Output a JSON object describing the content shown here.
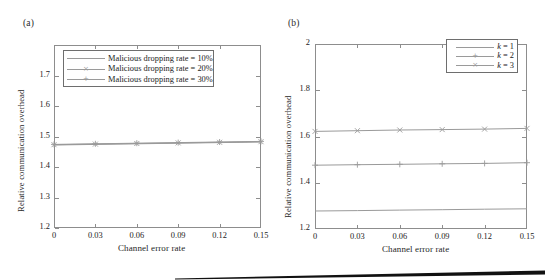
{
  "figure": {
    "panels": [
      {
        "tag": "(a)",
        "ylabel": "Relative communication overhead",
        "xlabel": "Channel error rate",
        "yticks": [
          "1.2",
          "1.3",
          "1.4",
          "1.5",
          "1.6",
          "1.7",
          ""
        ],
        "xticks": [
          "0",
          "0.03",
          "0.06",
          "0.09",
          "0.12",
          "0.15"
        ],
        "legend": [
          {
            "text": "Malicious dropping rate = 10%",
            "marker": "none"
          },
          {
            "text": "Malicious dropping rate = 20%",
            "marker": "x"
          },
          {
            "text": "Malicious dropping rate = 30%",
            "marker": "plus"
          }
        ]
      },
      {
        "tag": "(b)",
        "ylabel": "Relative communication overhead",
        "xlabel": "Channel error rate",
        "yticks": [
          "1.2",
          "1.4",
          "1.6",
          "1.8",
          "2"
        ],
        "xticks": [
          "0",
          "0.03",
          "0.06",
          "0.09",
          "0.12",
          "0.15"
        ],
        "legend": [
          {
            "text": "k = 1",
            "marker": "none"
          },
          {
            "text": "k = 2",
            "marker": "plus"
          },
          {
            "text": "k = 3",
            "marker": "x"
          }
        ]
      }
    ],
    "line_color": "#9a9a9a",
    "axis_color": "#8d8d8d"
  },
  "chart_data": [
    {
      "type": "line",
      "title": "(a)",
      "xlabel": "Channel error rate",
      "ylabel": "Relative communication overhead",
      "xlim": [
        0,
        0.15
      ],
      "ylim": [
        1.2,
        1.8
      ],
      "xticks": [
        0,
        0.03,
        0.06,
        0.09,
        0.12,
        0.15
      ],
      "yticks": [
        1.2,
        1.3,
        1.4,
        1.5,
        1.6,
        1.7
      ],
      "grid": false,
      "legend_position": "upper-left-inside",
      "x": [
        0,
        0.03,
        0.06,
        0.09,
        0.12,
        0.15
      ],
      "series": [
        {
          "name": "Malicious dropping rate = 10%",
          "marker": "none",
          "values": [
            1.472,
            1.474,
            1.476,
            1.478,
            1.48,
            1.482
          ]
        },
        {
          "name": "Malicious dropping rate = 20%",
          "marker": "x",
          "values": [
            1.473,
            1.475,
            1.477,
            1.479,
            1.481,
            1.483
          ]
        },
        {
          "name": "Malicious dropping rate = 30%",
          "marker": "plus",
          "values": [
            1.474,
            1.476,
            1.478,
            1.48,
            1.482,
            1.484
          ]
        }
      ]
    },
    {
      "type": "line",
      "title": "(b)",
      "xlabel": "Channel error rate",
      "ylabel": "Relative communication overhead",
      "xlim": [
        0,
        0.15
      ],
      "ylim": [
        1.2,
        2.0
      ],
      "xticks": [
        0,
        0.03,
        0.06,
        0.09,
        0.12,
        0.15
      ],
      "yticks": [
        1.2,
        1.4,
        1.6,
        1.8,
        2.0
      ],
      "grid": false,
      "legend_position": "upper-right-inside",
      "x": [
        0,
        0.03,
        0.06,
        0.09,
        0.12,
        0.15
      ],
      "series": [
        {
          "name": "k = 1",
          "marker": "none",
          "values": [
            1.278,
            1.28,
            1.282,
            1.284,
            1.286,
            1.288
          ]
        },
        {
          "name": "k = 2",
          "marker": "plus",
          "values": [
            1.476,
            1.478,
            1.48,
            1.482,
            1.484,
            1.487
          ]
        },
        {
          "name": "k = 3",
          "marker": "x",
          "values": [
            1.622,
            1.625,
            1.628,
            1.63,
            1.632,
            1.635
          ]
        }
      ]
    }
  ]
}
